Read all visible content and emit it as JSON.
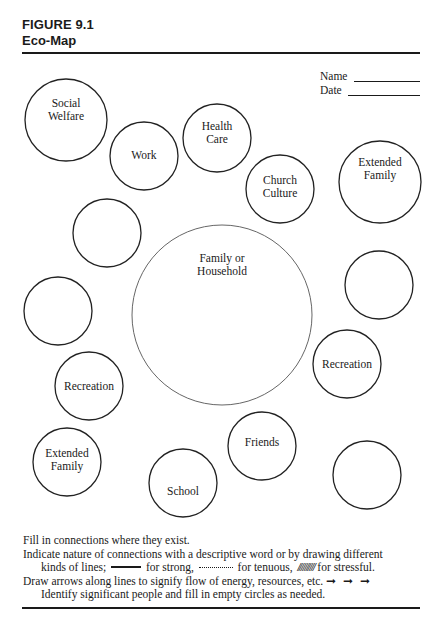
{
  "header": {
    "figure_label": "FIGURE 9.1",
    "title": "Eco-Map"
  },
  "fields": {
    "name_label": "Name",
    "date_label": "Date"
  },
  "diagram": {
    "center": {
      "label_lines": [
        "Family or",
        "Household"
      ],
      "cx": 222,
      "cy": 315,
      "r": 90
    },
    "nodes": [
      {
        "id": "social-welfare",
        "label_lines": [
          "Social",
          "Welfare"
        ],
        "cx": 66,
        "cy": 120,
        "r": 41
      },
      {
        "id": "work",
        "label_lines": [
          "Work"
        ],
        "cx": 144,
        "cy": 156,
        "r": 34
      },
      {
        "id": "health-care",
        "label_lines": [
          "Health",
          "Care"
        ],
        "cx": 217,
        "cy": 138,
        "r": 34
      },
      {
        "id": "church-culture",
        "label_lines": [
          "Church",
          "Culture"
        ],
        "cx": 280,
        "cy": 189,
        "r": 34
      },
      {
        "id": "extended-family-right",
        "label_lines": [
          "Extended",
          "Family"
        ],
        "cx": 380,
        "cy": 182,
        "r": 41
      },
      {
        "id": "empty-upper-left",
        "label_lines": [],
        "cx": 107,
        "cy": 233,
        "r": 34
      },
      {
        "id": "empty-left",
        "label_lines": [],
        "cx": 58,
        "cy": 311,
        "r": 34
      },
      {
        "id": "empty-right",
        "label_lines": [],
        "cx": 379,
        "cy": 285,
        "r": 34
      },
      {
        "id": "recreation-right",
        "label_lines": [
          "Recreation"
        ],
        "cx": 347,
        "cy": 364,
        "r": 34
      },
      {
        "id": "recreation-left",
        "label_lines": [
          "Recreation"
        ],
        "cx": 89,
        "cy": 386,
        "r": 34
      },
      {
        "id": "extended-family-left",
        "label_lines": [
          "Extended",
          "Family"
        ],
        "cx": 67,
        "cy": 462,
        "r": 34
      },
      {
        "id": "school",
        "label_lines": [
          "School"
        ],
        "cx": 183,
        "cy": 483,
        "r": 34
      },
      {
        "id": "friends",
        "label_lines": [
          "Friends"
        ],
        "cx": 262,
        "cy": 446,
        "r": 34
      },
      {
        "id": "empty-lower-right",
        "label_lines": [],
        "cx": 367,
        "cy": 475,
        "r": 34
      }
    ]
  },
  "instructions": {
    "line1": "Fill in connections where they exist.",
    "line2": "Indicate nature of connections with a descriptive word or by drawing different",
    "line3_prefix": "kinds of lines;",
    "line3_strong": "for strong,",
    "line3_tenuous": "for tenuous,",
    "line3_stress_glyph": "//////////",
    "line3_stressful": "for stressful.",
    "line4": "Draw arrows along lines to signify flow of energy, resources, etc.",
    "line4_arrows": "➞ ➞ ➞",
    "line5": "Identify significant people and fill in empty circles as needed."
  }
}
